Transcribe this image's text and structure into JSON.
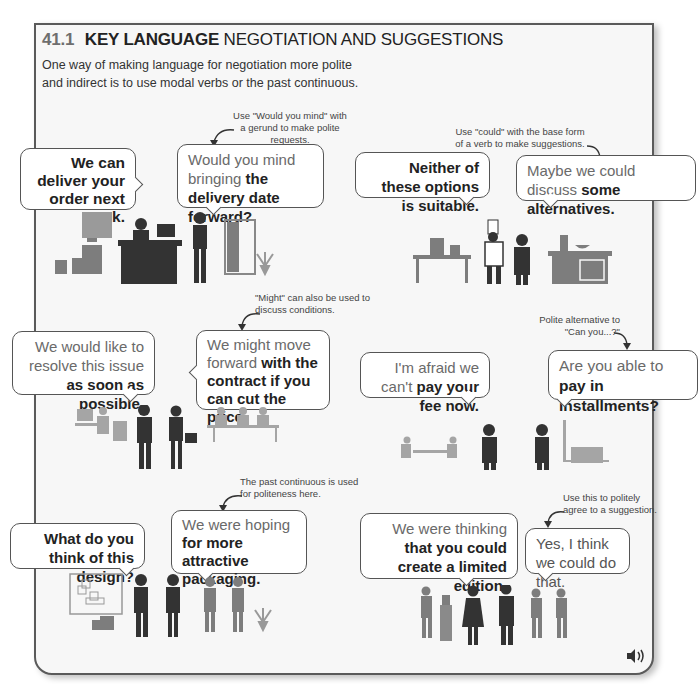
{
  "header": {
    "section_number": "41.1",
    "title_bold": "KEY LANGUAGE",
    "title_rest": "NEGOTIATION AND SUGGESTIONS",
    "intro_line1": "One way of making language for negotiation more polite",
    "intro_line2": "and indirect is to use modal verbs or the past continuous."
  },
  "scenes": [
    {
      "id": "delivery",
      "bubble_left": {
        "plain": "",
        "bold": "We can deliver your order next week."
      },
      "bubble_right": {
        "plain": "Would you mind bringing",
        "bold": "the delivery date forward?"
      },
      "note": "Use \"Would you mind\" with a gerund to make polite requests."
    },
    {
      "id": "kitchen",
      "bubble_left": {
        "plain": "",
        "bold": "Neither of these options is suitable."
      },
      "bubble_right": {
        "plain": "Maybe we could discuss",
        "bold": "some alternatives."
      },
      "note": "Use \"could\" with the base form of a verb to make suggestions."
    },
    {
      "id": "contract",
      "bubble_left": {
        "plain": "We would like to resolve this issue",
        "bold": "as soon as possible."
      },
      "bubble_right": {
        "plain": "We might move forward",
        "bold": "with the contract if you can cut the price."
      },
      "note": "\"Might\" can also be used to discuss conditions."
    },
    {
      "id": "installments",
      "bubble_left": {
        "plain": "I'm afraid we can't",
        "bold": "pay your fee now."
      },
      "bubble_right": {
        "plain": "Are you able to",
        "bold": "pay in installments?"
      },
      "note": "Polite alternative to \"Can you...?\""
    },
    {
      "id": "packaging",
      "bubble_left": {
        "plain": "",
        "bold": "What do you think of this design?"
      },
      "bubble_right": {
        "plain": "We were hoping",
        "bold": "for more attractive packaging."
      },
      "note": "The past continuous is used for politeness here."
    },
    {
      "id": "limited-edition",
      "bubble_left": {
        "plain": "We were thinking",
        "bold": "that you could create a limited edition."
      },
      "bubble_right": {
        "plain": "Yes, I think we could do that.",
        "bold": ""
      },
      "note": "Use this to politely agree to a suggestion."
    }
  ],
  "audio": {
    "icon": "speaker-icon"
  },
  "colors": {
    "section_number": "#6e6e6e",
    "dark_figure": "#333333",
    "mid_figure": "#7d7d7d",
    "panel_bg": "#f7f7f7",
    "border": "#5a5a5a"
  }
}
